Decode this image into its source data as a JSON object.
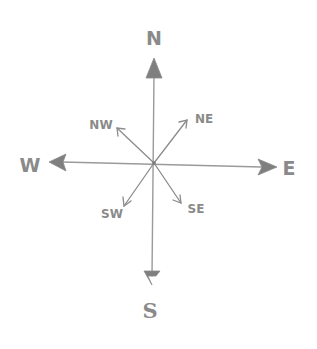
{
  "diagram": {
    "type": "compass-rose",
    "style": "hand-drawn pencil sketch",
    "background": "#ffffff",
    "ink_color": "#8a8a8a",
    "center": {
      "x": 154,
      "y": 163
    },
    "cardinal": [
      {
        "id": "north",
        "label": "N",
        "arrow_tip": {
          "x": 154,
          "y": 58
        },
        "label_pos": {
          "x": 154,
          "y": 45
        }
      },
      {
        "id": "south",
        "label": "S",
        "arrow_tip": {
          "x": 152,
          "y": 284
        },
        "label_pos": {
          "x": 150,
          "y": 316
        }
      },
      {
        "id": "west",
        "label": "W",
        "arrow_tip": {
          "x": 49,
          "y": 162
        },
        "label_pos": {
          "x": 30,
          "y": 172
        }
      },
      {
        "id": "east",
        "label": "E",
        "arrow_tip": {
          "x": 277,
          "y": 167
        },
        "label_pos": {
          "x": 288,
          "y": 175
        }
      }
    ],
    "intercardinal": [
      {
        "id": "northeast",
        "label": "NE",
        "arrow_tip": {
          "x": 187,
          "y": 120
        },
        "label_pos": {
          "x": 204,
          "y": 123
        }
      },
      {
        "id": "northwest",
        "label": "NW",
        "arrow_tip": {
          "x": 117,
          "y": 128
        },
        "label_pos": {
          "x": 101,
          "y": 129
        }
      },
      {
        "id": "southwest",
        "label": "SW",
        "arrow_tip": {
          "x": 124,
          "y": 206
        },
        "label_pos": {
          "x": 112,
          "y": 218
        }
      },
      {
        "id": "southeast",
        "label": "SE",
        "arrow_tip": {
          "x": 181,
          "y": 203
        },
        "label_pos": {
          "x": 196,
          "y": 213
        }
      }
    ]
  }
}
